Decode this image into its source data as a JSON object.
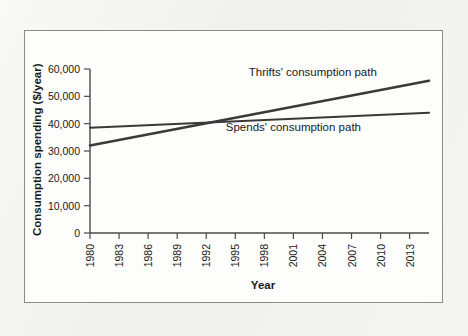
{
  "figure": {
    "background_color": "#f1f1ef",
    "panel_color": "#fdfdfc",
    "border_color": "#8b8b8b",
    "axis_color": "#4a4a4a"
  },
  "chart_data": {
    "type": "line",
    "title": "",
    "xlabel": "Year",
    "ylabel": "Consumption spending ($/year)",
    "xlim": [
      1980,
      2015
    ],
    "ylim": [
      0,
      60000
    ],
    "grid": false,
    "legend_position": "inline-annotations",
    "x_tick_labels": [
      "1980",
      "1983",
      "1986",
      "1989",
      "1992",
      "1995",
      "1998",
      "2001",
      "2004",
      "2007",
      "2010",
      "2013"
    ],
    "x_ticks": [
      1980,
      1983,
      1986,
      1989,
      1992,
      1995,
      1998,
      2001,
      2004,
      2007,
      2010,
      2013
    ],
    "y_tick_labels": [
      "0",
      "10,000",
      "20,000",
      "30,000",
      "40,000",
      "50,000",
      "60,000"
    ],
    "y_ticks": [
      0,
      10000,
      20000,
      30000,
      40000,
      50000,
      60000
    ],
    "x_tick_label_rotation": -90,
    "series": [
      {
        "name": "Thrifts' consumption path",
        "color": "#3a3a3a",
        "line_width": 2.6,
        "x": [
          1980,
          2015
        ],
        "values": [
          32000,
          55700
        ],
        "annotation": "Thrifts' consumption path",
        "annotation_x": 2003,
        "annotation_y": 57500
      },
      {
        "name": "Spends' consumption path",
        "color": "#3a3a3a",
        "line_width": 2.2,
        "x": [
          1980,
          2015
        ],
        "values": [
          38500,
          44000
        ],
        "annotation": "Spends' consumption path",
        "annotation_x": 2001,
        "annotation_y": 37200
      }
    ],
    "crossover": {
      "x": 1995.5,
      "y": 40000
    }
  }
}
